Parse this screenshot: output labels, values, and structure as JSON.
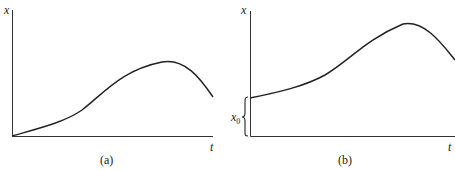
{
  "panels": [
    {
      "caption": "(a)",
      "y_label": "x",
      "x_label": "t",
      "description": "x(t) starts at origin, rises to a maximum, then decreases"
    },
    {
      "caption": "(b)",
      "y_label": "x",
      "x_label": "t",
      "initial_label": "x",
      "initial_subscript": "0",
      "description": "x(t) starts at initial value x0 > 0, rises to a maximum, then decreases"
    }
  ],
  "colors": {
    "line": "#222222",
    "background": "#ffffff"
  }
}
